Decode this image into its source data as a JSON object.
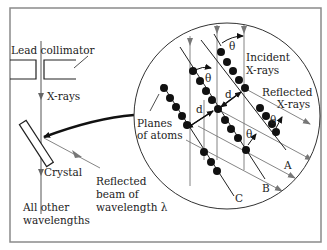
{
  "diagram": {
    "type": "x-ray-diffraction-bragg",
    "labels": {
      "lead_collimator": "Lead  collimator",
      "x_rays": "X-rays",
      "crystal": "Crystal",
      "reflected_beam_line1": "Reflected",
      "reflected_beam_line2": "beam of",
      "reflected_beam_line3": "wavelength λ",
      "all_other_line1": "All other",
      "all_other_line2": "wavelengths",
      "planes_line1": "Planes",
      "planes_line2": "of atoms",
      "incident_line1": "Incident",
      "incident_line2": "X-rays",
      "reflected_xrays_line1": "Reflected",
      "reflected_xrays_line2": "X-rays",
      "spacing": "d",
      "angle": "θ",
      "plane_a": "A",
      "plane_b": "B",
      "plane_c": "C"
    },
    "colors": {
      "frame": "#8a8a8a",
      "line": "#222222",
      "ray": "#777777",
      "atom": "#111111"
    }
  }
}
